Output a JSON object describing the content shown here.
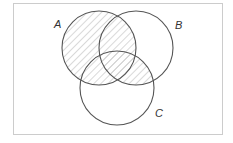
{
  "diagram": {
    "type": "venn",
    "shaded_region": "A ∪ (B ∩ C)",
    "sets": [
      {
        "label": "A",
        "cx": 99,
        "cy": 48,
        "r": 37
      },
      {
        "label": "B",
        "cx": 136,
        "cy": 48,
        "r": 37
      },
      {
        "label": "C",
        "cx": 117,
        "cy": 88,
        "r": 37
      }
    ],
    "labels": {
      "a": "A",
      "b": "B",
      "c": "C"
    },
    "colors": {
      "outline": "#555555",
      "hatch": "#c8c8c8",
      "frame": "#cccccc",
      "background": "#ffffff"
    }
  }
}
